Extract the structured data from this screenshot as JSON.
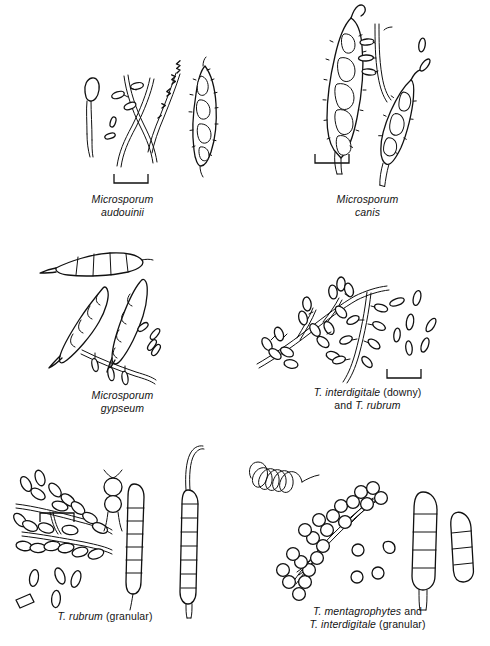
{
  "figure": {
    "kind": "scientific-line-drawing-plate",
    "background_color": "#ffffff",
    "ink_color": "#111111",
    "panel_count": 6,
    "layout": "3 rows x 2 columns"
  },
  "panels": [
    {
      "id": "microsporum-audouinii",
      "caption_lines": [
        {
          "text": "Microsporum",
          "style": "italic"
        },
        {
          "text": "audouinii",
          "style": "italic"
        }
      ],
      "scale_bar": {
        "present": true,
        "orientation": "ticks-up"
      },
      "structures": [
        "terminal chlamydoconidium on hypha",
        "pectinate (comb-like) hypha",
        "racquet hyphae",
        "few microconidia",
        "rough-walled multi-septate macroconidium"
      ]
    },
    {
      "id": "microsporum-canis",
      "caption_lines": [
        {
          "text": "Microsporum",
          "style": "italic"
        },
        {
          "text": "canis",
          "style": "italic"
        }
      ],
      "scale_bar": {
        "present": true,
        "orientation": "ticks-up"
      },
      "structures": [
        "large spindle-shaped rough-walled macroconidium with terminal knob",
        "second smaller macroconidium",
        "hypha bearing microconidia",
        "free microconidia"
      ]
    },
    {
      "id": "microsporum-gypseum",
      "caption_lines": [
        {
          "text": "Microsporum",
          "style": "italic"
        },
        {
          "text": "gypseum",
          "style": "italic"
        }
      ],
      "scale_bar": {
        "present": true,
        "orientation": "ticks-down"
      },
      "structures": [
        "three thin-walled ellipsoidal macroconidia with 4-6 cells",
        "free microconidia",
        "hypha with sessile microconidia"
      ]
    },
    {
      "id": "t-interdigitale-downy-and-t-rubrum",
      "caption_lines": [
        {
          "text": "T. interdigitale",
          "style": "italic"
        },
        {
          "text": " (downy)",
          "style": "normal"
        },
        {
          "text": "BREAK",
          "style": "break"
        },
        {
          "text": "and ",
          "style": "normal"
        },
        {
          "text": "T. rubrum",
          "style": "italic"
        }
      ],
      "scale_bar": {
        "present": true,
        "orientation": "ticks-up"
      },
      "structures": [
        "branching hypha with clustered pyriform microconidia",
        "hypha with microconidia borne along sides (birds-on-a-fence)",
        "free pyriform microconidia"
      ]
    },
    {
      "id": "t-rubrum-granular",
      "caption_lines": [
        {
          "text": "T. rubrum",
          "style": "italic"
        },
        {
          "text": " (granular)",
          "style": "normal"
        }
      ],
      "scale_bar": {
        "present": true,
        "orientation": "ticks-up"
      },
      "structures": [
        "hypha with abundant clavate microconidia",
        "intercalary chlamydoconidia chain",
        "free microconidia",
        "two long pencil-shaped multi-septate macroconidia"
      ]
    },
    {
      "id": "t-mentagrophytes-and-t-interdigitale-granular",
      "caption_lines": [
        {
          "text": "T. mentagrophytes",
          "style": "italic"
        },
        {
          "text": " and",
          "style": "normal"
        },
        {
          "text": "BREAK",
          "style": "break"
        },
        {
          "text": "T. interdigitale",
          "style": "italic"
        },
        {
          "text": " (granular)",
          "style": "normal"
        }
      ],
      "scale_bar": {
        "present": true,
        "orientation": "ticks-up"
      },
      "structures": [
        "coiled spiral hypha",
        "hypha with dense grape-like clusters of globose microconidia",
        "free globose microconidia",
        "two cigar-shaped multi-septate macroconidia"
      ]
    }
  ]
}
